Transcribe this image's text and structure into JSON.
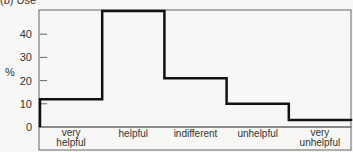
{
  "chart_data": {
    "type": "bar",
    "style": "step",
    "title": "(b) Use",
    "xlabel": "",
    "ylabel": "%",
    "categories": [
      "very helpful",
      "helpful",
      "indifferent",
      "unhelpful",
      "very unhelpful"
    ],
    "category_lines": [
      [
        "very",
        "helpful"
      ],
      [
        "helpful"
      ],
      [
        "indifferent"
      ],
      [
        "unhelpful"
      ],
      [
        "very",
        "unhelpful"
      ]
    ],
    "values": [
      12,
      50,
      21,
      10,
      3
    ],
    "yticks": [
      0,
      10,
      20,
      30,
      40
    ],
    "ylim": [
      0,
      50
    ],
    "grid": false,
    "legend": null
  }
}
